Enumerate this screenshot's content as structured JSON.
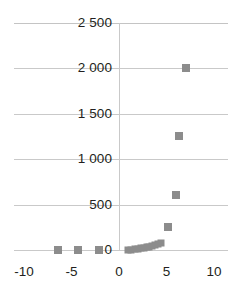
{
  "chart_data": {
    "type": "scatter",
    "title": "",
    "xlabel": "",
    "ylabel": "",
    "xlim": [
      -11.5,
      11.5
    ],
    "ylim": [
      -60,
      2500
    ],
    "grid": true,
    "legend": null,
    "marker_color": "#8c8c8c",
    "marker_shape": "square",
    "gridline_color": "#c9c9c9",
    "text_color": "#231f20",
    "xticks": [
      -10,
      -5,
      0,
      5,
      10
    ],
    "xtick_labels": [
      "-10",
      "-5",
      "0",
      "5",
      "10"
    ],
    "yticks": [
      0,
      500,
      1000,
      1500,
      2000,
      2500
    ],
    "ytick_labels": [
      "0",
      "500",
      "1 000",
      "1 500",
      "2 000",
      "2 500"
    ],
    "points": [
      {
        "x": -6.4,
        "y": 0
      },
      {
        "x": -4.3,
        "y": 0
      },
      {
        "x": -2.1,
        "y": 0
      },
      {
        "x": 0.9,
        "y": 2
      },
      {
        "x": 1.3,
        "y": 5
      },
      {
        "x": 1.7,
        "y": 8
      },
      {
        "x": 2.0,
        "y": 12
      },
      {
        "x": 2.3,
        "y": 18
      },
      {
        "x": 2.6,
        "y": 24
      },
      {
        "x": 2.9,
        "y": 30
      },
      {
        "x": 3.2,
        "y": 38
      },
      {
        "x": 3.5,
        "y": 45
      },
      {
        "x": 3.8,
        "y": 55
      },
      {
        "x": 4.1,
        "y": 68
      },
      {
        "x": 4.4,
        "y": 80
      },
      {
        "x": 5.2,
        "y": 250
      },
      {
        "x": 6.0,
        "y": 600
      },
      {
        "x": 6.3,
        "y": 1250
      },
      {
        "x": 7.0,
        "y": 2000
      }
    ]
  }
}
